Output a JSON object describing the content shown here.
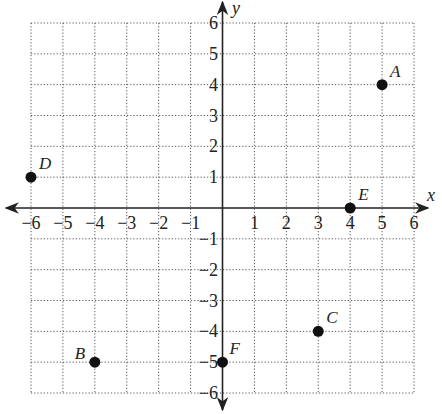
{
  "chart_data": {
    "type": "scatter",
    "title": "",
    "xlabel": "x",
    "ylabel": "y",
    "xlim": [
      -6,
      6
    ],
    "ylim": [
      -6,
      6
    ],
    "grid": true,
    "grid_style": "dotted",
    "x_ticks": [
      -6,
      -5,
      -4,
      -3,
      -2,
      -1,
      1,
      2,
      3,
      4,
      5,
      6
    ],
    "y_ticks": [
      6,
      5,
      4,
      3,
      2,
      1,
      -1,
      -2,
      -3,
      -4,
      -5,
      -6
    ],
    "x_tick_labels": [
      "−6",
      "−5",
      "−4",
      "−3",
      "−2",
      "−1",
      "1",
      "2",
      "3",
      "4",
      "5",
      "6"
    ],
    "y_tick_labels": [
      "6",
      "5",
      "4",
      "3",
      "2",
      "1",
      "−1",
      "−2",
      "−3",
      "−4",
      "−5",
      "−6"
    ],
    "points": [
      {
        "label": "A",
        "x": 5,
        "y": 4
      },
      {
        "label": "B",
        "x": -4,
        "y": -5
      },
      {
        "label": "C",
        "x": 3,
        "y": -4
      },
      {
        "label": "D",
        "x": -6,
        "y": 1
      },
      {
        "label": "E",
        "x": 4,
        "y": 0
      },
      {
        "label": "F",
        "x": 0,
        "y": -5
      }
    ]
  },
  "axes": {
    "x_name": "x",
    "y_name": "y"
  },
  "colors": {
    "point": "#111111",
    "axis": "#222222",
    "grid": "#555555"
  }
}
